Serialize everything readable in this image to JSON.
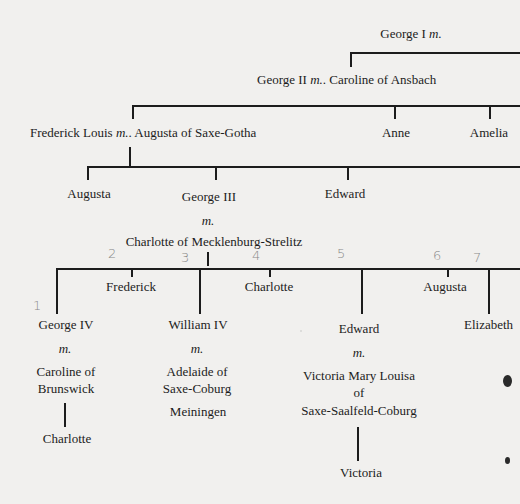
{
  "diagram": {
    "type": "family-tree",
    "generations": [
      {
        "level": 1,
        "people": [
          {
            "name": "George I",
            "spouse_marker": "m."
          }
        ]
      },
      {
        "level": 2,
        "people": [
          {
            "name": "George II",
            "marker": "m.",
            "spouse": "Caroline of Ansbach"
          }
        ]
      },
      {
        "level": 3,
        "people": [
          {
            "name": "Frederick Louis",
            "marker": "m.",
            "spouse": "Augusta of Saxe-Gotha"
          },
          {
            "name": "Anne"
          },
          {
            "name": "Amelia"
          }
        ]
      },
      {
        "level": 4,
        "people": [
          {
            "name": "Augusta"
          },
          {
            "name": "George III",
            "marker": "m.",
            "spouse": "Charlotte of Mecklenburg-Strelitz"
          },
          {
            "name": "Edward"
          }
        ]
      },
      {
        "level": 5,
        "people": [
          {
            "name": "George IV",
            "marker": "m.",
            "spouse": [
              "Caroline of",
              "Brunswick"
            ],
            "child": "Charlotte",
            "annotation": "1"
          },
          {
            "name": "Frederick",
            "annotation": "2"
          },
          {
            "name": "William IV",
            "marker": "m.",
            "spouse": [
              "Adelaide of",
              "Saxe-Coburg",
              "Meiningen"
            ],
            "annotation": "3"
          },
          {
            "name": "Charlotte",
            "annotation": "4"
          },
          {
            "name": "Edward",
            "marker": "m.",
            "spouse": [
              "Victoria Mary Louisa",
              "of",
              "Saxe-Saalfeld-Coburg"
            ],
            "child": "Victoria",
            "annotation": "5"
          },
          {
            "name": "Augusta",
            "annotation": "6"
          },
          {
            "name": "Elizabeth",
            "annotation": "7"
          }
        ]
      }
    ]
  },
  "labels": {
    "george1": "George I",
    "george1_m": "m.",
    "george2": "George II",
    "george2_m": "m.",
    "caroline_ansbach": ". Caroline of Ansbach",
    "frederick_louis": "Frederick Louis",
    "frederick_louis_m": "m.",
    "augusta_saxe_gotha": ". Augusta of Saxe-Gotha",
    "anne": "Anne",
    "amelia": "Amelia",
    "augusta_g4": "Augusta",
    "george3": "George III",
    "george3_m": "m.",
    "charlotte_mecklenburg": "Charlotte of Mecklenburg-Strelitz",
    "edward_g4": "Edward",
    "george4": "George IV",
    "george4_m": "m.",
    "caroline_of": "Caroline of",
    "brunswick": "Brunswick",
    "charlotte_child": "Charlotte",
    "frederick_g5": "Frederick",
    "william4": "William IV",
    "william4_m": "m.",
    "adelaide_of": "Adelaide of",
    "saxe_coburg": "Saxe-Coburg",
    "meiningen": "Meiningen",
    "charlotte_g5": "Charlotte",
    "edward_g5": "Edward",
    "edward_g5_m": "m.",
    "victoria_mary_louisa": "Victoria Mary Louisa",
    "of": "of",
    "saxe_saalfeld": "Saxe-Saalfeld-Coburg",
    "victoria": "Victoria",
    "augusta_g5": "Augusta",
    "elizabeth": "Elizabeth"
  },
  "annotations": {
    "n1": "1",
    "n2": "2",
    "n3": "3",
    "n4": "4",
    "n5": "5",
    "n6": "6",
    "n7": "7"
  }
}
